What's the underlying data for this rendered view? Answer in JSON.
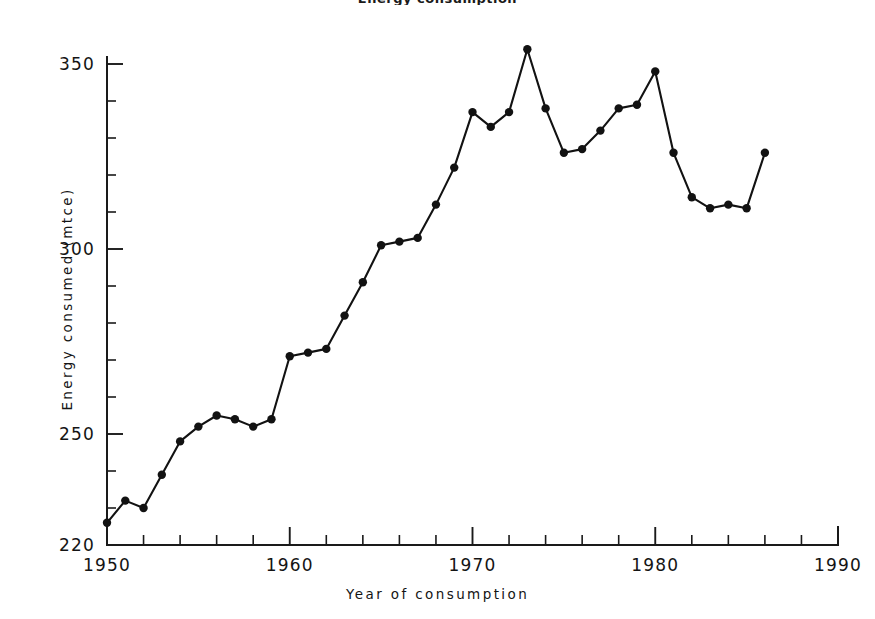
{
  "figure": {
    "title_partial": "Energy consumption",
    "background_color": "#ffffff",
    "ink_color": "#121212"
  },
  "axis_titles": {
    "x": "Year of consumption",
    "y": "Energy consumed (mtce)"
  },
  "x_tick_labels": [
    "1950",
    "1960",
    "1970",
    "1980",
    "1990"
  ],
  "y_tick_labels": [
    "220",
    "250",
    "300",
    "350"
  ],
  "chart_data": {
    "type": "line",
    "title": "Energy consumption",
    "xlabel": "Year of consumption",
    "ylabel": "Energy consumed (mtce)",
    "xlim": [
      1950,
      1990
    ],
    "ylim": [
      220,
      355
    ],
    "grid": false,
    "legend": false,
    "x_major_ticks": [
      1950,
      1960,
      1970,
      1980,
      1990
    ],
    "x_minor_tick_interval": 2,
    "y_major_ticks": [
      220,
      250,
      300,
      350
    ],
    "y_minor_tick_interval": 10,
    "marker": "filled-circle",
    "series": [
      {
        "name": "Energy consumed (mtce)",
        "x": [
          1950,
          1951,
          1952,
          1953,
          1954,
          1955,
          1956,
          1957,
          1958,
          1959,
          1960,
          1961,
          1962,
          1963,
          1964,
          1965,
          1966,
          1967,
          1968,
          1969,
          1970,
          1971,
          1972,
          1973,
          1974,
          1975,
          1976,
          1977,
          1978,
          1979,
          1980,
          1981,
          1982,
          1983,
          1984,
          1985,
          1986
        ],
        "values": [
          226,
          232,
          230,
          239,
          248,
          252,
          255,
          254,
          252,
          254,
          271,
          272,
          273,
          282,
          291,
          301,
          302,
          303,
          312,
          322,
          337,
          333,
          337,
          354,
          338,
          326,
          327,
          332,
          338,
          339,
          348,
          326,
          314,
          311,
          312,
          311,
          326
        ],
        "values_note": "final point 1986 = 337",
        "color": "#121212"
      }
    ]
  }
}
